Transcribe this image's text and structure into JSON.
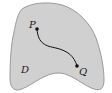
{
  "diagram": {
    "region": {
      "label": "D",
      "fill": "#d0d0d0",
      "stroke": "#9a9a9a"
    },
    "points": [
      {
        "label": "P",
        "x": 37,
        "y": 29
      },
      {
        "label": "Q",
        "x": 77,
        "y": 66
      }
    ],
    "path": {
      "from": "P",
      "to": "Q",
      "color": "#111111"
    }
  }
}
